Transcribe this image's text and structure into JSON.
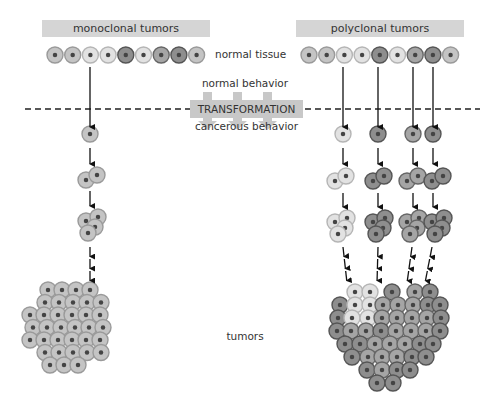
{
  "headers": {
    "monoclonal": "monoclonal tumors",
    "polyclonal": "polyclonal tumors"
  },
  "labels": {
    "normal_tissue": "normal tissue",
    "normal_behavior": "normal behavior",
    "transformation": "TRANSFORMATION",
    "cancerous_behavior": "cancerous behavior",
    "tumors": "tumors"
  },
  "colors": {
    "header_bg": "#d5d5d5",
    "transform_bg": "#c8c8c8",
    "cell_light": "#e2e2e2",
    "cell_mid": "#c4c4c4",
    "cell_dark": "#8e8e8e",
    "cell_medium_dark": "#a5a5a5",
    "nucleus": "#444444"
  },
  "normal_tissue_row": {
    "cell_shades": [
      "mid",
      "mid",
      "light",
      "light",
      "dark",
      "light",
      "medium_dark",
      "dark",
      "mid"
    ]
  },
  "monoclonal": {
    "transformed_clones": 1,
    "stages": [
      "1 cell",
      "2 cells",
      "4 cells",
      "tumor mass"
    ]
  },
  "polyclonal": {
    "transformed_clones": 4,
    "clone_shades": [
      "light",
      "dark",
      "medium_dark",
      "dark"
    ],
    "stages": [
      "1 cell",
      "2 cells",
      "4 cells",
      "tumor mass"
    ]
  }
}
